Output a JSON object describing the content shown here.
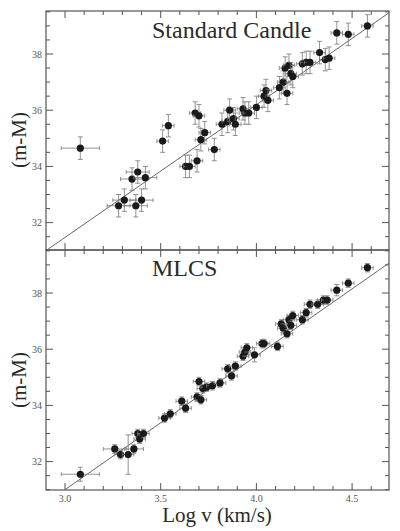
{
  "chart_data": [
    {
      "type": "scatter",
      "title": "Standard Candle",
      "xlabel": "Log v (km/s)",
      "ylabel": "(m-M)",
      "xlim": [
        2.9,
        4.7
      ],
      "ylim": [
        31.0,
        39.5
      ],
      "xticks": [
        3.0,
        3.5,
        4.0,
        4.5
      ],
      "yticks": [
        32,
        34,
        36,
        38
      ],
      "grid": false,
      "fit_line": {
        "x": [
          2.9,
          4.7
        ],
        "y": [
          31.0,
          39.5
        ]
      },
      "points": [
        {
          "x": 3.08,
          "y": 34.65,
          "xerr": 0.1,
          "yerr": 0.4
        },
        {
          "x": 3.28,
          "y": 32.6,
          "xerr": 0.06,
          "yerr": 0.4
        },
        {
          "x": 3.31,
          "y": 32.8,
          "xerr": 0.06,
          "yerr": 0.4
        },
        {
          "x": 3.35,
          "y": 33.55,
          "xerr": 0.06,
          "yerr": 0.4
        },
        {
          "x": 3.37,
          "y": 32.6,
          "xerr": 0.06,
          "yerr": 0.4
        },
        {
          "x": 3.38,
          "y": 33.8,
          "xerr": 0.06,
          "yerr": 0.4
        },
        {
          "x": 3.4,
          "y": 32.8,
          "xerr": 0.06,
          "yerr": 0.4
        },
        {
          "x": 3.42,
          "y": 33.6,
          "xerr": 0.06,
          "yerr": 0.4
        },
        {
          "x": 3.51,
          "y": 34.9,
          "xerr": 0.03,
          "yerr": 0.4
        },
        {
          "x": 3.54,
          "y": 35.45,
          "xerr": 0.03,
          "yerr": 0.4
        },
        {
          "x": 3.63,
          "y": 34.0,
          "xerr": 0.03,
          "yerr": 0.4
        },
        {
          "x": 3.65,
          "y": 34.0,
          "xerr": 0.03,
          "yerr": 0.4
        },
        {
          "x": 3.68,
          "y": 35.9,
          "xerr": 0.03,
          "yerr": 0.4
        },
        {
          "x": 3.69,
          "y": 34.2,
          "xerr": 0.03,
          "yerr": 0.4
        },
        {
          "x": 3.7,
          "y": 35.8,
          "xerr": 0.03,
          "yerr": 0.4
        },
        {
          "x": 3.71,
          "y": 34.95,
          "xerr": 0.03,
          "yerr": 0.4
        },
        {
          "x": 3.73,
          "y": 35.2,
          "xerr": 0.03,
          "yerr": 0.4
        },
        {
          "x": 3.78,
          "y": 34.6,
          "xerr": 0.03,
          "yerr": 0.4
        },
        {
          "x": 3.82,
          "y": 35.5,
          "xerr": 0.03,
          "yerr": 0.4
        },
        {
          "x": 3.85,
          "y": 35.6,
          "xerr": 0.03,
          "yerr": 0.4
        },
        {
          "x": 3.86,
          "y": 36.0,
          "xerr": 0.03,
          "yerr": 0.4
        },
        {
          "x": 3.88,
          "y": 35.7,
          "xerr": 0.03,
          "yerr": 0.4
        },
        {
          "x": 3.89,
          "y": 35.5,
          "xerr": 0.03,
          "yerr": 0.4
        },
        {
          "x": 3.93,
          "y": 36.05,
          "xerr": 0.03,
          "yerr": 0.4
        },
        {
          "x": 3.94,
          "y": 35.9,
          "xerr": 0.03,
          "yerr": 0.4
        },
        {
          "x": 3.96,
          "y": 35.9,
          "xerr": 0.03,
          "yerr": 0.4
        },
        {
          "x": 4.0,
          "y": 36.1,
          "xerr": 0.03,
          "yerr": 0.4
        },
        {
          "x": 4.04,
          "y": 36.5,
          "xerr": 0.03,
          "yerr": 0.4
        },
        {
          "x": 4.05,
          "y": 36.7,
          "xerr": 0.03,
          "yerr": 0.4
        },
        {
          "x": 4.06,
          "y": 36.35,
          "xerr": 0.03,
          "yerr": 0.4
        },
        {
          "x": 4.12,
          "y": 36.8,
          "xerr": 0.03,
          "yerr": 0.4
        },
        {
          "x": 4.14,
          "y": 37.0,
          "xerr": 0.03,
          "yerr": 0.4
        },
        {
          "x": 4.15,
          "y": 37.5,
          "xerr": 0.03,
          "yerr": 0.4
        },
        {
          "x": 4.16,
          "y": 36.6,
          "xerr": 0.03,
          "yerr": 0.4
        },
        {
          "x": 4.17,
          "y": 37.6,
          "xerr": 0.03,
          "yerr": 0.4
        },
        {
          "x": 4.18,
          "y": 37.3,
          "xerr": 0.03,
          "yerr": 0.4
        },
        {
          "x": 4.19,
          "y": 37.2,
          "xerr": 0.03,
          "yerr": 0.4
        },
        {
          "x": 4.24,
          "y": 37.65,
          "xerr": 0.03,
          "yerr": 0.4
        },
        {
          "x": 4.26,
          "y": 37.7,
          "xerr": 0.03,
          "yerr": 0.4
        },
        {
          "x": 4.28,
          "y": 37.7,
          "xerr": 0.03,
          "yerr": 0.4
        },
        {
          "x": 4.33,
          "y": 38.05,
          "xerr": 0.03,
          "yerr": 0.4
        },
        {
          "x": 4.36,
          "y": 37.8,
          "xerr": 0.03,
          "yerr": 0.4
        },
        {
          "x": 4.38,
          "y": 37.85,
          "xerr": 0.03,
          "yerr": 0.4
        },
        {
          "x": 4.42,
          "y": 38.75,
          "xerr": 0.03,
          "yerr": 0.4
        },
        {
          "x": 4.48,
          "y": 38.7,
          "xerr": 0.03,
          "yerr": 0.4
        },
        {
          "x": 4.58,
          "y": 39.0,
          "xerr": 0.03,
          "yerr": 0.4
        }
      ]
    },
    {
      "type": "scatter",
      "title": "MLCS",
      "xlabel": "Log v (km/s)",
      "ylabel": "(m-M)",
      "xlim": [
        2.9,
        4.7
      ],
      "ylim": [
        31.0,
        39.5
      ],
      "xticks": [
        3.0,
        3.5,
        4.0,
        4.5
      ],
      "yticks": [
        32,
        34,
        36,
        38
      ],
      "grid": false,
      "fit_line": {
        "x": [
          3.0,
          4.7
        ],
        "y": [
          31.0,
          39.1
        ]
      },
      "points": [
        {
          "x": 3.08,
          "y": 31.55,
          "xerr": 0.1,
          "yerr": 0.25
        },
        {
          "x": 3.26,
          "y": 32.45,
          "xerr": 0.06,
          "yerr": 0.15
        },
        {
          "x": 3.29,
          "y": 32.25,
          "xerr": 0.03,
          "yerr": 0.15
        },
        {
          "x": 3.33,
          "y": 32.25,
          "xerr": 0.03,
          "yerr": 0.7
        },
        {
          "x": 3.36,
          "y": 32.45,
          "xerr": 0.05,
          "yerr": 0.15
        },
        {
          "x": 3.38,
          "y": 33.0,
          "xerr": 0.03,
          "yerr": 0.15
        },
        {
          "x": 3.39,
          "y": 32.8,
          "xerr": 0.03,
          "yerr": 0.15
        },
        {
          "x": 3.41,
          "y": 33.0,
          "xerr": 0.03,
          "yerr": 0.15
        },
        {
          "x": 3.52,
          "y": 33.55,
          "xerr": 0.03,
          "yerr": 0.15
        },
        {
          "x": 3.55,
          "y": 33.7,
          "xerr": 0.03,
          "yerr": 0.15
        },
        {
          "x": 3.61,
          "y": 34.15,
          "xerr": 0.03,
          "yerr": 0.15
        },
        {
          "x": 3.63,
          "y": 33.9,
          "xerr": 0.03,
          "yerr": 0.15
        },
        {
          "x": 3.69,
          "y": 34.3,
          "xerr": 0.03,
          "yerr": 0.15
        },
        {
          "x": 3.7,
          "y": 34.85,
          "xerr": 0.03,
          "yerr": 0.15
        },
        {
          "x": 3.71,
          "y": 34.2,
          "xerr": 0.03,
          "yerr": 0.15
        },
        {
          "x": 3.72,
          "y": 34.6,
          "xerr": 0.03,
          "yerr": 0.15
        },
        {
          "x": 3.74,
          "y": 34.65,
          "xerr": 0.03,
          "yerr": 0.15
        },
        {
          "x": 3.77,
          "y": 34.7,
          "xerr": 0.03,
          "yerr": 0.15
        },
        {
          "x": 3.81,
          "y": 34.8,
          "xerr": 0.03,
          "yerr": 0.15
        },
        {
          "x": 3.85,
          "y": 35.3,
          "xerr": 0.03,
          "yerr": 0.15
        },
        {
          "x": 3.87,
          "y": 35.05,
          "xerr": 0.03,
          "yerr": 0.15
        },
        {
          "x": 3.89,
          "y": 35.4,
          "xerr": 0.03,
          "yerr": 0.15
        },
        {
          "x": 3.93,
          "y": 35.75,
          "xerr": 0.03,
          "yerr": 0.15
        },
        {
          "x": 3.94,
          "y": 35.9,
          "xerr": 0.03,
          "yerr": 0.15
        },
        {
          "x": 3.95,
          "y": 36.05,
          "xerr": 0.03,
          "yerr": 0.15
        },
        {
          "x": 3.99,
          "y": 35.8,
          "xerr": 0.03,
          "yerr": 0.25
        },
        {
          "x": 4.03,
          "y": 36.2,
          "xerr": 0.03,
          "yerr": 0.15
        },
        {
          "x": 4.04,
          "y": 36.2,
          "xerr": 0.03,
          "yerr": 0.15
        },
        {
          "x": 4.11,
          "y": 36.1,
          "xerr": 0.03,
          "yerr": 0.15
        },
        {
          "x": 4.13,
          "y": 36.9,
          "xerr": 0.03,
          "yerr": 0.15
        },
        {
          "x": 4.14,
          "y": 36.75,
          "xerr": 0.03,
          "yerr": 0.15
        },
        {
          "x": 4.16,
          "y": 36.55,
          "xerr": 0.03,
          "yerr": 0.15
        },
        {
          "x": 4.17,
          "y": 37.05,
          "xerr": 0.03,
          "yerr": 0.15
        },
        {
          "x": 4.18,
          "y": 36.85,
          "xerr": 0.03,
          "yerr": 0.15
        },
        {
          "x": 4.19,
          "y": 37.2,
          "xerr": 0.03,
          "yerr": 0.15
        },
        {
          "x": 4.24,
          "y": 37.05,
          "xerr": 0.03,
          "yerr": 0.15
        },
        {
          "x": 4.26,
          "y": 37.3,
          "xerr": 0.03,
          "yerr": 0.15
        },
        {
          "x": 4.28,
          "y": 37.6,
          "xerr": 0.03,
          "yerr": 0.15
        },
        {
          "x": 4.32,
          "y": 37.6,
          "xerr": 0.03,
          "yerr": 0.15
        },
        {
          "x": 4.35,
          "y": 37.75,
          "xerr": 0.03,
          "yerr": 0.15
        },
        {
          "x": 4.37,
          "y": 37.75,
          "xerr": 0.03,
          "yerr": 0.15
        },
        {
          "x": 4.42,
          "y": 38.1,
          "xerr": 0.03,
          "yerr": 0.2
        },
        {
          "x": 4.48,
          "y": 38.35,
          "xerr": 0.03,
          "yerr": 0.15
        },
        {
          "x": 4.58,
          "y": 38.9,
          "xerr": 0.03,
          "yerr": 0.15
        }
      ]
    }
  ],
  "labels": {
    "top_title": "Standard Candle",
    "bottom_title": "MLCS",
    "xlabel": "Log v (km/s)",
    "ylabel": "(m-M)",
    "x_tick_labels": [
      "3.0",
      "3.5",
      "4.0",
      "4.5"
    ],
    "y_tick_labels": [
      "32",
      "34",
      "36",
      "38"
    ]
  }
}
